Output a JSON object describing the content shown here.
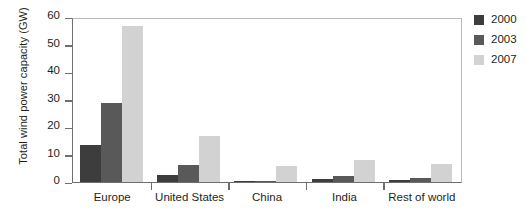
{
  "chart_data": {
    "type": "bar",
    "title": "",
    "xlabel": "",
    "ylabel": "Total wind power capacity (GW)",
    "categories": [
      "Europe",
      "United States",
      "China",
      "India",
      "Rest of  world"
    ],
    "series": [
      {
        "name": "2000",
        "color": "#3d3d3d",
        "values": [
          13.5,
          2.5,
          0.35,
          1.2,
          0.8
        ]
      },
      {
        "name": "2003",
        "color": "#595959",
        "values": [
          29.0,
          6.4,
          0.55,
          2.1,
          1.5
        ]
      },
      {
        "name": "2007",
        "color": "#d2d2d2",
        "values": [
          57.0,
          16.8,
          6.0,
          8.0,
          6.5
        ]
      }
    ],
    "ylim": [
      0,
      60
    ],
    "yticks": [
      0,
      10,
      20,
      30,
      40,
      50,
      60
    ],
    "ytick_labels": [
      "0",
      "10",
      "20",
      "30",
      "40",
      "50",
      "60"
    ],
    "grid": false,
    "legend_position": "right"
  },
  "legend": {
    "items": [
      {
        "label": "2000",
        "color": "#3d3d3d"
      },
      {
        "label": "2003",
        "color": "#595959"
      },
      {
        "label": "2007",
        "color": "#d2d2d2"
      }
    ]
  }
}
